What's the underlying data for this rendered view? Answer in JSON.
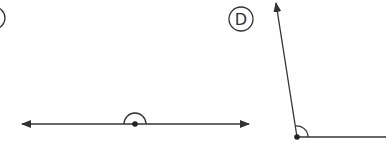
{
  "diagram": {
    "type": "angles",
    "stroke_color": "#333333",
    "figures": [
      {
        "label": "C",
        "label_visible": "partial",
        "angle_type": "straight",
        "description": "Straight line with arrows at both ends and a marked vertex point with a semicircular angle arc"
      },
      {
        "label": "D",
        "angle_type": "obtuse",
        "description": "Angle with a horizontal ray to the right and a ray up-left ending in an arrow, with an angle arc at the vertex"
      }
    ]
  }
}
